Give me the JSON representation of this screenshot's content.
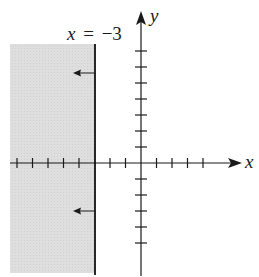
{
  "chart_data": {
    "type": "region",
    "title": "",
    "xlabel": "x",
    "ylabel": "y",
    "boundary_label_var": "x",
    "boundary_label_eq": "=",
    "boundary_label_value": "−3",
    "boundary": {
      "type": "vertical_line",
      "x": -3,
      "style": "solid"
    },
    "shaded_region": {
      "inequality": "x < -3",
      "side": "left",
      "color": "#d9d9d9"
    },
    "direction_arrows": [
      {
        "y": 5.7,
        "direction": "left"
      },
      {
        "y": -3.1,
        "direction": "left"
      }
    ],
    "x_ticks": [
      -8,
      -7,
      -6,
      -5,
      -4,
      -3,
      -2,
      -1,
      1,
      2,
      3,
      4
    ],
    "y_ticks": [
      -5,
      -4,
      -3,
      -2,
      -1,
      1,
      2,
      3,
      4,
      5,
      6,
      7
    ],
    "xlim": [
      -8.5,
      6.5
    ],
    "ylim": [
      -7.3,
      9.8
    ],
    "grid": false,
    "tick_labels_shown": false
  },
  "colors": {
    "shade": "#d9d9d9",
    "axis": "#1a1a1a",
    "boundary": "#111111"
  }
}
